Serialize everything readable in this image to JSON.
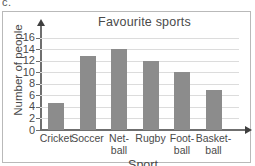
{
  "question_label": "c.",
  "chart_data": {
    "type": "bar",
    "title": "Favourite sports",
    "xlabel": "Sport",
    "ylabel": "Number of people",
    "categories": [
      "Cricket",
      "Soccer",
      "Net-\nball",
      "Rugby",
      "Foot-\nball",
      "Basket-\nball"
    ],
    "values": [
      4.7,
      12.8,
      14,
      12,
      10,
      7
    ],
    "ylim": [
      0,
      17
    ],
    "yticks": [
      0,
      2,
      4,
      6,
      8,
      10,
      12,
      14,
      16
    ],
    "ytick_labels": [
      "0",
      "2",
      "4",
      "6",
      "8",
      "10",
      "12",
      "14",
      "16"
    ],
    "grid": true,
    "legend": false,
    "bar_color": "#8c8c8c",
    "grid_color": "#dcdcdc",
    "axis_color": "#6f6f6f"
  }
}
